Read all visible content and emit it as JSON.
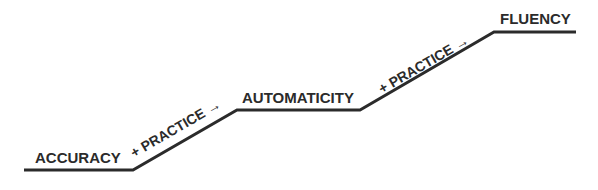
{
  "diagram": {
    "stages": [
      {
        "label": "ACCURACY"
      },
      {
        "label": "AUTOMATICITY"
      },
      {
        "label": "FLUENCY"
      }
    ],
    "transitions": [
      {
        "label": "+ PRACTICE →"
      },
      {
        "label": "+ PRACTICE →"
      }
    ],
    "colors": {
      "line": "#2b2b2b",
      "text": "#2b2b2b",
      "background": "#ffffff"
    }
  }
}
